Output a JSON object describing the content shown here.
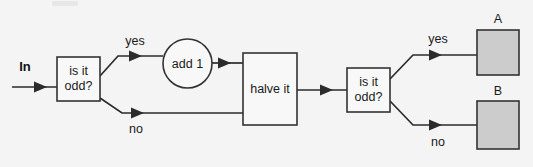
{
  "diagram": {
    "background_color": "#f4f4f4",
    "stroke_color": "#333333",
    "fill_white": "#f8f8f8",
    "fill_gray": "#cccccc",
    "input_label": "In",
    "nodes": [
      {
        "id": "decide1",
        "shape": "rectangle",
        "line1": "is it",
        "line2": "odd?"
      },
      {
        "id": "add1",
        "shape": "circle",
        "line1": "add 1"
      },
      {
        "id": "halve",
        "shape": "rectangle",
        "line1": "halve it"
      },
      {
        "id": "decide2",
        "shape": "rectangle",
        "line1": "is it",
        "line2": "odd?"
      },
      {
        "id": "outA",
        "shape": "rectangle-filled",
        "caption": "A"
      },
      {
        "id": "outB",
        "shape": "rectangle-filled",
        "caption": "B"
      }
    ],
    "edges": [
      {
        "from": "In",
        "to": "decide1",
        "label": ""
      },
      {
        "from": "decide1",
        "to": "add1",
        "label": "yes"
      },
      {
        "from": "decide1",
        "to": "halve",
        "label": "no"
      },
      {
        "from": "add1",
        "to": "halve",
        "label": ""
      },
      {
        "from": "halve",
        "to": "decide2",
        "label": ""
      },
      {
        "from": "decide2",
        "to": "outA",
        "label": "yes"
      },
      {
        "from": "decide2",
        "to": "outB",
        "label": "no"
      }
    ],
    "edge_labels": {
      "yes1": "yes",
      "no1": "no",
      "yes2": "yes",
      "no2": "no"
    },
    "output_captions": {
      "a": "A",
      "b": "B"
    }
  }
}
